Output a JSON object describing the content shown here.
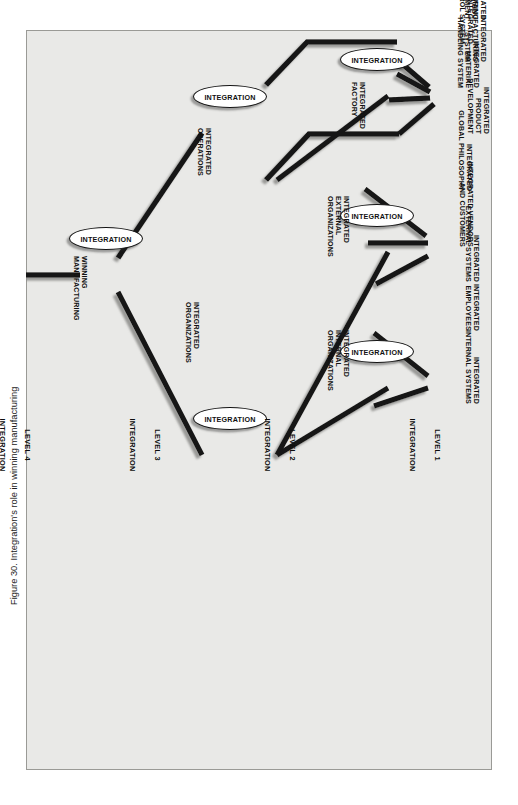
{
  "caption": "Figure 30. Integration's role in winning manufacturing",
  "node_label": "INTEGRATION",
  "colors": {
    "background": "#ffffff",
    "figure_fill": "#e9e9e7",
    "frame_border": "#9a9a96",
    "line": "#141414",
    "line_shadow": "#8b8b88",
    "text": "#111111"
  },
  "levels": [
    {
      "id": "level-1",
      "line1": "LEVEL 1",
      "line2": "INTEGRATION"
    },
    {
      "id": "level-2",
      "line1": "LEVEL 2",
      "line2": "INTEGRATION"
    },
    {
      "id": "level-3",
      "line1": "LEVEL 3",
      "line2": "INTEGRATION"
    },
    {
      "id": "level-4",
      "line1": "LEVEL 4",
      "line2": "INTEGRATION"
    }
  ],
  "inputs": [
    {
      "id": "integrated-internal-systems",
      "text": "INTEGRATED\nINTERNAL SYSTEMS"
    },
    {
      "id": "integrated-employees",
      "text": "INTEGRATED\nEMPLOYEES"
    },
    {
      "id": "integrated-external-systems",
      "text": "INTEGRATED\nEXTERNAL SYSTEMS"
    },
    {
      "id": "integrated-vendors-and-customers",
      "text": "INTEGRATED VENDORS\nAND CUSTOMERS"
    },
    {
      "id": "integrated-global-philosophy",
      "text": "INTEGRATED\nGLOBAL PHILOSOPHY"
    },
    {
      "id": "integrated-product-development",
      "text": "INTEGRATED\nPRODUCT\nDEVELOPMENT"
    },
    {
      "id": "integrated-material-handling-system",
      "text": "INTEGRATED\nMATERIAL\nHANDLING SYSTEM"
    },
    {
      "id": "integrated-manufacturing-system",
      "text": "INTEGRATED\nMANUFACTURING\nSYSTEM"
    },
    {
      "id": "integrated-control-system",
      "text": "INTEGRATED\nCONTROL SYSTEM"
    },
    {
      "id": "integrated-manufacturing-management",
      "text": "INTEGRATED\nMANUFACTURING\nMANAGEMENT"
    }
  ],
  "intermediate": [
    {
      "id": "integrated-internal-organizations",
      "text": "INTEGRATED\nINTERNAL\nORGANIZATIONS"
    },
    {
      "id": "integrated-external-organizations",
      "text": "INTEGRATED\nEXTERNAL\nORGANIZATIONS"
    },
    {
      "id": "integrated-factory",
      "text": "INTEGRATED\nFACTORY"
    },
    {
      "id": "integrated-organizations",
      "text": "INTEGRATED\nORGANIZATIONS"
    },
    {
      "id": "integrated-operations",
      "text": "INTEGRATED\nOPERATIONS"
    }
  ],
  "output": {
    "id": "winning-manufacturing",
    "text": "WINNING\nMANUFACTURING"
  },
  "nodes": [
    {
      "id": "node-internal-org",
      "level": 1
    },
    {
      "id": "node-external-org",
      "level": 1
    },
    {
      "id": "node-factory",
      "level": 1
    },
    {
      "id": "node-organizations",
      "level": 2
    },
    {
      "id": "node-operations",
      "level": 2
    },
    {
      "id": "node-winning",
      "level": 3
    }
  ]
}
